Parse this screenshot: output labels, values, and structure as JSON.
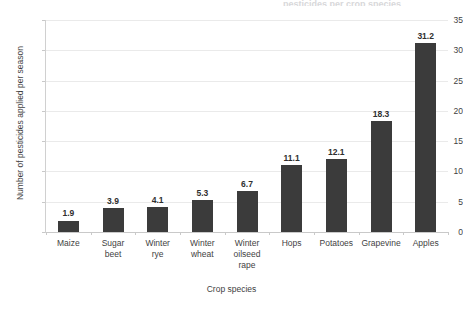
{
  "chart_data": {
    "type": "bar",
    "title": "",
    "title_fragment": "pesticides per crop species",
    "xlabel": "Crop species",
    "ylabel": "Number of pesticides applied per season",
    "categories": [
      "Maize",
      "Sugar beet",
      "Winter rye",
      "Winter wheat",
      "Winter oilseed rape",
      "Hops",
      "Potatoes",
      "Grapevine",
      "Apples"
    ],
    "category_lines": [
      [
        "Maize"
      ],
      [
        "Sugar",
        "beet"
      ],
      [
        "Winter",
        "rye"
      ],
      [
        "Winter",
        "wheat"
      ],
      [
        "Winter",
        "oilseed",
        "rape"
      ],
      [
        "Hops"
      ],
      [
        "Potatoes"
      ],
      [
        "Grapevine"
      ],
      [
        "Apples"
      ]
    ],
    "values": [
      1.9,
      3.9,
      4.1,
      5.3,
      6.7,
      11.1,
      12.1,
      18.3,
      31.2
    ],
    "value_labels": [
      "1.9",
      "3.9",
      "4.1",
      "5.3",
      "6.7",
      "11.1",
      "12.1",
      "18.3",
      "31.2"
    ],
    "ylim": [
      0,
      35
    ],
    "yticks": [
      0,
      5,
      10,
      15,
      20,
      25,
      30,
      35
    ],
    "ytick_labels": [
      "0",
      "5",
      "10",
      "15",
      "20",
      "25",
      "30",
      "35"
    ],
    "grid": true,
    "legend": false,
    "bar_color": "#3b3b3b",
    "gridline_color": "#eaeaea",
    "axis_color": "#c9c9c9",
    "background_color": "#ffffff",
    "text_color": "#3f3f3f"
  }
}
